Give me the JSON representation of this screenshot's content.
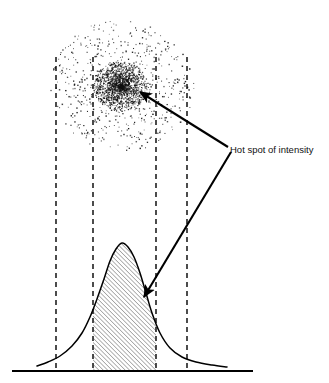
{
  "figure": {
    "title": "",
    "annotations": [
      {
        "id": "hot-spot-label",
        "text": "Hot spot of intensity",
        "x": 230,
        "y": 153,
        "font_size": 9.5,
        "color": "#111111"
      }
    ],
    "colors": {
      "ink": "#111111",
      "stroke": "#000000",
      "background": "#ffffff",
      "hatch": "#222222",
      "dot": "#111111",
      "dash": "#000000"
    }
  },
  "chart_data": {
    "type": "line",
    "xlabel": "",
    "ylabel": "",
    "grid": false,
    "legend_position": "none",
    "axis": {
      "baseline_y": 371,
      "baseline_x_start": 12,
      "baseline_x_end": 253,
      "xlim": [
        12,
        253
      ],
      "ylim": [
        0,
        128
      ]
    },
    "series": [
      {
        "name": "Intensity profile",
        "type": "line",
        "note": "Gaussian-like bell curve, peak near x=122",
        "peak_x": 122,
        "peak_y_px": 243,
        "x": [
          37,
          48,
          60,
          72,
          82,
          90,
          97,
          104,
          110,
          116,
          122,
          128,
          134,
          140,
          146,
          152,
          160,
          170,
          182,
          196,
          212,
          227
        ],
        "values": [
          5,
          9,
          15,
          25,
          38,
          54,
          72,
          92,
          110,
          122,
          128,
          124,
          114,
          98,
          78,
          58,
          38,
          23,
          14,
          9,
          6,
          4
        ]
      }
    ],
    "shaded_region": {
      "name": "Hot spot band",
      "style": "diagonal-hatch",
      "hatch_angle_deg": 45,
      "hatch_spacing_px": 3,
      "x_start": 93,
      "x_end": 156
    },
    "reference_lines": [
      {
        "name": "band-edge-1",
        "x": 56,
        "style": "dashed",
        "y_top": 57,
        "y_bottom": 371
      },
      {
        "name": "band-edge-2",
        "x": 93,
        "style": "dashed",
        "y_top": 57,
        "y_bottom": 371
      },
      {
        "name": "band-edge-3",
        "x": 156,
        "style": "dashed",
        "y_top": 57,
        "y_bottom": 371
      },
      {
        "name": "band-edge-4",
        "x": 187,
        "style": "dashed",
        "y_top": 57,
        "y_bottom": 371
      }
    ],
    "point_cloud": {
      "name": "Beam spot stipple",
      "description": "Diffuse circular scatter of dots with a dense hot core",
      "center_x": 122,
      "center_y": 85,
      "outer_radius": 72,
      "core_center_x": 120,
      "core_center_y": 86,
      "core_radius": 27,
      "outer_point_count": 620,
      "core_point_count": 1450
    },
    "callouts": [
      {
        "name": "callout-to-hot-core",
        "from_x": 228,
        "from_y": 147,
        "to_x": 140,
        "to_y": 92
      },
      {
        "name": "callout-to-shaded-peak",
        "from_x": 231,
        "from_y": 152,
        "to_x": 144,
        "to_y": 297
      }
    ]
  }
}
